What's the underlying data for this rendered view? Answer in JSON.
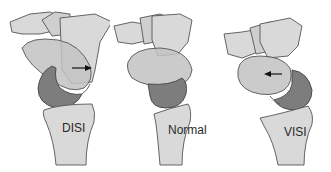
{
  "figure": {
    "panels": [
      {
        "label": "DISI",
        "arrow_direction": "right"
      },
      {
        "label": "Normal",
        "arrow_direction": "none"
      },
      {
        "label": "VISI",
        "arrow_direction": "left"
      }
    ],
    "colors": {
      "bone_light": "#d9d9d9",
      "bone_mid": "#c2c2c2",
      "lunate_dark": "#7d7d7d",
      "outline": "#555555",
      "background": "#ffffff"
    }
  }
}
